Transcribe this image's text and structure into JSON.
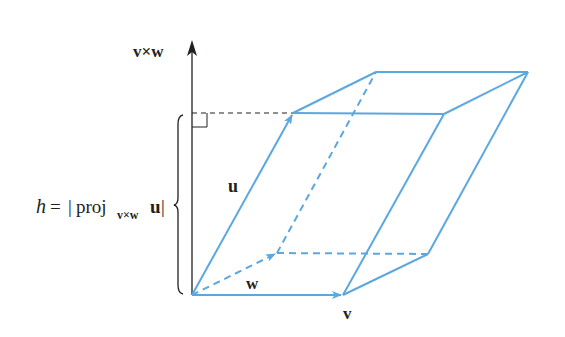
{
  "figure": {
    "colors": {
      "edge": "#5ba7df",
      "axis": "#231f20",
      "background": "#ffffff"
    },
    "labels": {
      "axis": "v×w",
      "u": "u",
      "v": "v",
      "w": "w",
      "height_lhs": "h",
      "height_eq": "=",
      "height_bar_open": "|",
      "height_proj": "proj",
      "height_sub": "v×w",
      "height_vec": "u",
      "height_bar_close": "|"
    },
    "vertices": {
      "origin": [
        192,
        295
      ],
      "v_tip": [
        343,
        295
      ],
      "w_tip": [
        277,
        253
      ],
      "v_plus_w": [
        428,
        254
      ],
      "u_tip": [
        293,
        113
      ],
      "u_plus_v": [
        444,
        114
      ],
      "u_plus_w": [
        376,
        72
      ],
      "u_plus_v_plus_w": [
        528,
        72
      ]
    }
  }
}
